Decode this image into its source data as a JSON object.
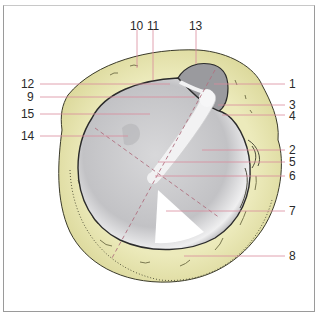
{
  "diagram": {
    "type": "anatomical-illustration",
    "colors": {
      "bone": "#e9e8b8",
      "bone_dark": "#c9c68a",
      "membrane": "#c9c9cc",
      "membrane_light": "#eeeeef",
      "outline": "#2b2b2b",
      "leader_line": "#d6889a",
      "cone_of_light": "#ffffff"
    },
    "labels_left": [
      {
        "id": "12",
        "text": "12",
        "y": 84
      },
      {
        "id": "9",
        "text": "9",
        "y": 97
      },
      {
        "id": "15",
        "text": "15",
        "y": 114
      },
      {
        "id": "14",
        "text": "14",
        "y": 136
      }
    ],
    "labels_top": [
      {
        "id": "10",
        "text": "10",
        "x": 137
      },
      {
        "id": "11",
        "text": "11",
        "x": 153
      },
      {
        "id": "13",
        "text": "13",
        "x": 196
      }
    ],
    "labels_right": [
      {
        "id": "1",
        "text": "1",
        "y": 84
      },
      {
        "id": "3",
        "text": "3",
        "y": 105
      },
      {
        "id": "4",
        "text": "4",
        "y": 115
      },
      {
        "id": "2",
        "text": "2",
        "y": 150
      },
      {
        "id": "5",
        "text": "5",
        "y": 162
      },
      {
        "id": "6",
        "text": "6",
        "y": 176
      },
      {
        "id": "7",
        "text": "7",
        "y": 211
      },
      {
        "id": "8",
        "text": "8",
        "y": 256
      }
    ]
  }
}
